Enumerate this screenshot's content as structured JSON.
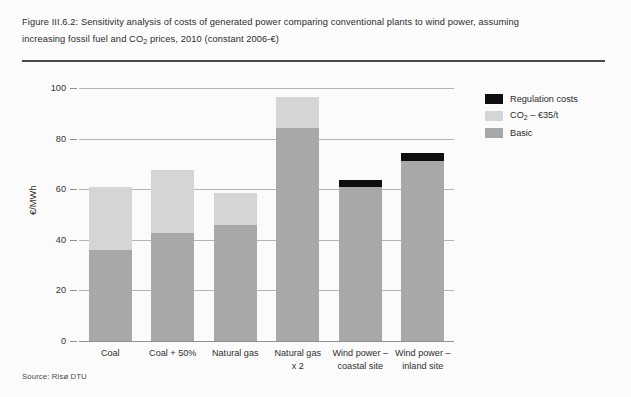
{
  "figure": {
    "caption_line1": "Figure III.6.2: Sensitivity analysis of costs of generated power comparing conventional plants to wind power, assuming",
    "caption_line2_a": "increasing fossil fuel and CO",
    "caption_line2_sub": "2",
    "caption_line2_b": " prices, 2010 (constant 2006-€)",
    "source": "Source: Risø DTU"
  },
  "legend": {
    "position": "top-right",
    "items": [
      {
        "label": "Regulation costs",
        "color": "#0e0e0e"
      },
      {
        "label_a": "CO",
        "label_sub": "2",
        "label_b": " – €35/t",
        "label": "CO2 – €35/t",
        "color": "#d5d5d5"
      },
      {
        "label": "Basic",
        "color": "#a8a8a8"
      }
    ]
  },
  "chart_data": {
    "type": "bar",
    "stacked": true,
    "title": "Sensitivity analysis of costs of generated power comparing conventional plants to wind power, assuming increasing fossil fuel and CO2 prices, 2010 (constant 2006-€)",
    "xlabel": "",
    "ylabel": "€/MWh",
    "ylim": [
      0,
      100
    ],
    "yticks": [
      0,
      20,
      40,
      60,
      80,
      100
    ],
    "ytick_labels": [
      "0",
      "20",
      "40",
      "60",
      "80",
      "100"
    ],
    "grid": true,
    "categories": [
      "Coal",
      "Coal + 50%",
      "Natural gas",
      "Natural gas\nx 2",
      "Wind power –\ncoastal site",
      "Wind power –\ninland site"
    ],
    "series": [
      {
        "name": "Basic",
        "color": "#a8a8a8",
        "values": [
          36.0,
          42.5,
          46.0,
          84.0,
          61.0,
          71.0
        ]
      },
      {
        "name": "CO2 – €35/t",
        "color": "#d5d5d5",
        "values": [
          25.0,
          25.0,
          12.5,
          12.5,
          0.0,
          0.0
        ]
      },
      {
        "name": "Regulation costs",
        "color": "#0e0e0e",
        "values": [
          0.0,
          0.0,
          0.0,
          0.0,
          2.8,
          3.2
        ]
      }
    ],
    "totals": [
      61.0,
      67.5,
      58.5,
      96.5,
      63.8,
      74.2
    ]
  }
}
